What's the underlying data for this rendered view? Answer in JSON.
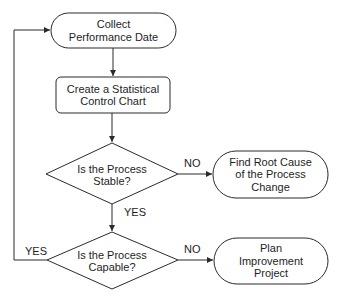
{
  "diagram": {
    "type": "flowchart",
    "nodes": [
      {
        "id": "collect",
        "shape": "terminal",
        "lines": [
          "Collect",
          "Performance Date"
        ]
      },
      {
        "id": "chart",
        "shape": "process",
        "lines": [
          "Create a Statistical",
          "Control Chart"
        ]
      },
      {
        "id": "stable",
        "shape": "decision",
        "lines": [
          "Is the Process",
          "Stable?"
        ]
      },
      {
        "id": "rootcause",
        "shape": "terminal",
        "lines": [
          "Find Root Cause",
          "of the Process",
          "Change"
        ]
      },
      {
        "id": "capable",
        "shape": "decision",
        "lines": [
          "Is the Process",
          "Capable?"
        ]
      },
      {
        "id": "plan",
        "shape": "terminal",
        "lines": [
          "Plan",
          "Improvement",
          "Project"
        ]
      }
    ],
    "edges": [
      {
        "from": "collect",
        "to": "chart",
        "label": ""
      },
      {
        "from": "chart",
        "to": "stable",
        "label": ""
      },
      {
        "from": "stable",
        "to": "rootcause",
        "label": "NO"
      },
      {
        "from": "stable",
        "to": "capable",
        "label": "YES"
      },
      {
        "from": "capable",
        "to": "plan",
        "label": "NO"
      },
      {
        "from": "capable",
        "to": "collect",
        "label": "YES"
      }
    ],
    "colors": {
      "stroke": "#2a2a2a",
      "fill": "#ffffff",
      "text": "#1e1e1e"
    }
  }
}
